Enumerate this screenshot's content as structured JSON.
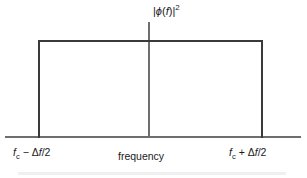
{
  "figure": {
    "type": "rectangular-spectrum-diagram",
    "colors": {
      "background": "#ffffff",
      "spectrum_outline": "#3a3a3a",
      "axis": "#6e6e6e",
      "text": "#1a1a1a"
    },
    "y_axis": {
      "label_plain": "|ϕ(f)|²",
      "symbol": "ϕ",
      "variable": "f",
      "exponent": "2"
    },
    "x_axis": {
      "label": "frequency",
      "tick_left_plain": "f_c − Δf/2",
      "tick_right_plain": "f_c + Δf/2",
      "tick_left": {
        "base": "f",
        "subscript": "c",
        "operator": "−",
        "delta": "Δ",
        "delta_var": "f",
        "divisor": "/2"
      },
      "tick_right": {
        "base": "f",
        "subscript": "c",
        "operator": "+",
        "delta": "Δ",
        "delta_var": "f",
        "divisor": "/2"
      }
    },
    "spectrum": {
      "shape": "rectangle",
      "amplitude_flat": true,
      "left_edge_label": "f_c − Δf/2",
      "right_edge_label": "f_c + Δf/2",
      "center": "f_c",
      "bandwidth": "Δf"
    }
  },
  "chart_data": {
    "type": "area",
    "title": "",
    "xlabel": "frequency",
    "ylabel": "|ϕ(f)|²",
    "grid": false,
    "legend": null,
    "x_tick_labels": [
      "f_c − Δf/2",
      "f_c + Δf/2"
    ],
    "x": [
      "f_c − Δf/2",
      "f_c − Δf/2",
      "f_c + Δf/2",
      "f_c + Δf/2"
    ],
    "values": [
      0,
      1,
      1,
      0
    ],
    "annotations": []
  }
}
